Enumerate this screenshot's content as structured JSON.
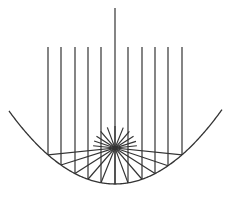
{
  "diagram": {
    "stroke_color": "#333333",
    "background": "#ffffff",
    "parabola": {
      "vertex": [
        115,
        184
      ],
      "curvature": 0.0065,
      "x_range": [
        9,
        222
      ]
    },
    "focus": [
      115,
      148
    ],
    "incoming_rays_x": [
      48,
      61,
      75,
      88,
      101,
      115,
      128,
      142,
      155,
      168,
      182
    ],
    "center_ray_top": 8,
    "side_rays_top": 47
  }
}
